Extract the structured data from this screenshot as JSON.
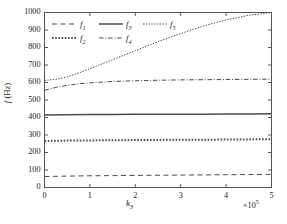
{
  "chart_data": {
    "type": "line",
    "title": "",
    "xlabel": "k₃",
    "xlabel_base": "k",
    "xlabel_sub": "3",
    "ylabel": "f (Hz)",
    "ylabel_base": "f",
    "ylabel_unit": " (Hz)",
    "x_multiplier": "×10",
    "x_multiplier_exp": "5",
    "xlim": [
      0,
      5
    ],
    "ylim": [
      0,
      1000
    ],
    "xticks": [
      "0",
      "1",
      "2",
      "3",
      "4",
      "5"
    ],
    "xtick_values": [
      0,
      1,
      2,
      3,
      4,
      5
    ],
    "yticks": [
      "0",
      "100",
      "200",
      "300",
      "400",
      "500",
      "600",
      "700",
      "800",
      "900",
      "1000"
    ],
    "ytick_values": [
      0,
      100,
      200,
      300,
      400,
      500,
      600,
      700,
      800,
      900,
      1000
    ],
    "grid": false,
    "legend_position": "upper left",
    "line_color": "#4a4a4a",
    "axis_color": "#555555",
    "series": [
      {
        "name": "f₁",
        "label_base": "f",
        "label_sub": "1",
        "style": "dashed",
        "x": [
          0,
          0.5,
          1,
          1.5,
          2,
          2.5,
          3,
          3.5,
          4,
          4.5,
          5
        ],
        "values": [
          63,
          65,
          67,
          68,
          69,
          70,
          71,
          72,
          73,
          74,
          75
        ]
      },
      {
        "name": "f₂",
        "label_base": "f",
        "label_sub": "2",
        "style": "dotted-thick",
        "x": [
          0,
          0.5,
          1,
          1.5,
          2,
          2.5,
          3,
          3.5,
          4,
          4.5,
          5
        ],
        "values": [
          266,
          268,
          269,
          270,
          271,
          272,
          273,
          273,
          274,
          275,
          276
        ]
      },
      {
        "name": "f₃",
        "label_base": "f",
        "label_sub": "3",
        "style": "solid",
        "x": [
          0,
          0.5,
          1,
          1.5,
          2,
          2.5,
          3,
          3.5,
          4,
          4.5,
          5
        ],
        "values": [
          415,
          416,
          417,
          417,
          418,
          418,
          419,
          419,
          420,
          420,
          421
        ]
      },
      {
        "name": "f₄",
        "label_base": "f",
        "label_sub": "4",
        "style": "dash-dot",
        "x": [
          0,
          0.25,
          0.5,
          0.75,
          1,
          1.5,
          2,
          2.5,
          3,
          3.5,
          4,
          4.5,
          5
        ],
        "values": [
          555,
          572,
          584,
          592,
          598,
          606,
          610,
          613,
          615,
          616,
          617,
          618,
          619
        ]
      },
      {
        "name": "f₅",
        "label_base": "f",
        "label_sub": "5",
        "style": "dotted-fine",
        "x": [
          0,
          0.25,
          0.5,
          0.75,
          1,
          1.5,
          2,
          2.5,
          3,
          3.5,
          4,
          4.5,
          5
        ],
        "values": [
          612,
          618,
          632,
          654,
          679,
          730,
          782,
          833,
          880,
          923,
          958,
          984,
          1000
        ]
      }
    ]
  },
  "legend": {
    "entries": [
      {
        "label_base": "f",
        "label_sub": "1",
        "style": "dashed"
      },
      {
        "label_base": "f",
        "label_sub": "3",
        "style": "solid"
      },
      {
        "label_base": "f",
        "label_sub": "5",
        "style": "dotted-fine"
      },
      {
        "label_base": "f",
        "label_sub": "2",
        "style": "dotted-thick"
      },
      {
        "label_base": "f",
        "label_sub": "4",
        "style": "dash-dot"
      }
    ]
  }
}
